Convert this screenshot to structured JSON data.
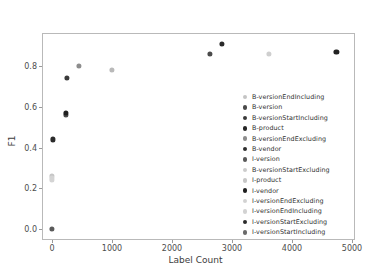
{
  "chart_data": {
    "type": "scatter",
    "title": "",
    "xlabel": "Label Count",
    "ylabel": "F1",
    "xlim": [
      -250,
      5000
    ],
    "ylim": [
      -0.06,
      0.96
    ],
    "xticks": [
      "0",
      "1000",
      "2000",
      "3000",
      "4000",
      "5000"
    ],
    "xtick_values": [
      0,
      1000,
      2000,
      3000,
      4000,
      5000
    ],
    "yticks": [
      "0.0",
      "0.2",
      "0.4",
      "0.6",
      "0.8"
    ],
    "ytick_values": [
      0.0,
      0.2,
      0.4,
      0.6,
      0.8
    ],
    "grid": false,
    "legend_position": "center right",
    "marker_size": 5,
    "points": [
      {
        "label": "B-versionEndIncluding",
        "x": 1000,
        "y": 0.78,
        "color": "#b9b9b9"
      },
      {
        "label": "B-version",
        "x": 2630,
        "y": 0.86,
        "color": "#4a4a4a"
      },
      {
        "label": "B-versionStartIncluding",
        "x": 2830,
        "y": 0.91,
        "color": "#2a2a2a"
      },
      {
        "label": "B-product",
        "x": 4740,
        "y": 0.87,
        "color": "#222222"
      },
      {
        "label": "B-versionEndExcluding",
        "x": 450,
        "y": 0.8,
        "color": "#8d8d8d"
      },
      {
        "label": "B-vendor",
        "x": 250,
        "y": 0.74,
        "color": "#3b3b3b"
      },
      {
        "label": "I-version",
        "x": 235,
        "y": 0.56,
        "color": "#4a4a4a"
      },
      {
        "label": "B-versionStartExcluding",
        "x": 3620,
        "y": 0.86,
        "color": "#cfcfcf"
      },
      {
        "label": "I-product",
        "x": 5,
        "y": 0.26,
        "color": "#c6c6c6"
      },
      {
        "label": "I-vendor",
        "x": 235,
        "y": 0.57,
        "color": "#1f1f1f"
      },
      {
        "label": "I-versionEndExcluding",
        "x": 3,
        "y": 0.25,
        "color": "#d4d4d4"
      },
      {
        "label": "I-versionEndIncluding",
        "x": 2,
        "y": 0.24,
        "color": "#d4d4d4"
      },
      {
        "label": "I-versionStartExcluding",
        "x": 15,
        "y": 0.44,
        "color": "#2b2b2b"
      },
      {
        "label": "I-versionStartIncluding",
        "x": 0,
        "y": 0.0,
        "color": "#5a5a5a"
      }
    ],
    "legend_entries": [
      {
        "label": "B-versionEndIncluding",
        "color": "#c4c4c4"
      },
      {
        "label": "B-version",
        "color": "#4a4a4a"
      },
      {
        "label": "B-versionStartIncluding",
        "color": "#3a3a3a"
      },
      {
        "label": "B-product",
        "color": "#262626"
      },
      {
        "label": "B-versionEndExcluding",
        "color": "#8d8d8d"
      },
      {
        "label": "B-vendor",
        "color": "#2e2e2e"
      },
      {
        "label": "I-version",
        "color": "#585858"
      },
      {
        "label": "B-versionStartExcluding",
        "color": "#cccccc"
      },
      {
        "label": "I-product",
        "color": "#c6c6c6"
      },
      {
        "label": "I-vendor",
        "color": "#1f1f1f"
      },
      {
        "label": "I-versionEndExcluding",
        "color": "#d2d2d2"
      },
      {
        "label": "I-versionEndIncluding",
        "color": "#d2d2d2"
      },
      {
        "label": "I-versionStartExcluding",
        "color": "#2b2b2b"
      },
      {
        "label": "I-versionStartIncluding",
        "color": "#6a6a6a"
      }
    ]
  }
}
